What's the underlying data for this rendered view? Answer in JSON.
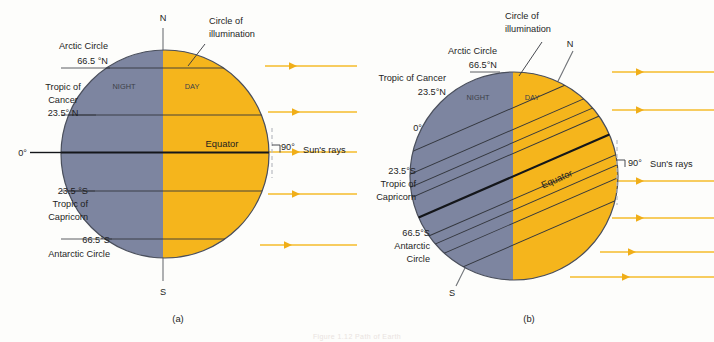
{
  "figure": {
    "title_faint": "Figure 1.12  Path of Earth",
    "background": "#fdfdfb",
    "colors": {
      "night": "#7d85a0",
      "day": "#f5b51c",
      "ray": "#f5bb2b",
      "outline": "#4a4f5c",
      "grid_line": "#33363d",
      "equator_line": "#14161a",
      "axis_line": "#6e7176"
    }
  },
  "panels": [
    {
      "id": "a",
      "caption": "(a)",
      "pole_north_label": "N",
      "pole_south_label": "S",
      "circle_of_illumination_label": "Circle of\nillumination",
      "circle_of_illumination_line1": "Circle of",
      "circle_of_illumination_line2": "illumination",
      "night_label": "NIGHT",
      "day_label": "DAY",
      "equator_label": "Equator",
      "angle_label": "90°",
      "suns_rays_label": "Sun's rays",
      "latitudes": [
        {
          "name": "arctic-circle",
          "lines": [
            "Arctic Circle",
            "66.5 °N"
          ],
          "value": 66.5,
          "hemisphere": "N"
        },
        {
          "name": "tropic-of-cancer",
          "lines": [
            "Tropic of",
            "Cancer",
            "23.5° N"
          ],
          "value": 23.5,
          "hemisphere": "N"
        },
        {
          "name": "equator",
          "lines": [
            "0°"
          ],
          "value": 0,
          "hemisphere": ""
        },
        {
          "name": "tropic-of-capricorn",
          "lines": [
            "23.5 °S",
            "Tropic of",
            "Capricorn"
          ],
          "value": 23.5,
          "hemisphere": "S"
        },
        {
          "name": "antarctic-circle",
          "lines": [
            "66.5°S",
            "Antarctic Circle"
          ],
          "value": 66.5,
          "hemisphere": "S"
        }
      ]
    },
    {
      "id": "b",
      "caption": "(b)",
      "pole_north_label": "N",
      "pole_south_label": "S",
      "circle_of_illumination_line1": "Circle of",
      "circle_of_illumination_line2": "illumination",
      "night_label": "NIGHT",
      "day_label": "DAY",
      "equator_label": "Equator",
      "angle_label": "90°",
      "suns_rays_label": "Sun's rays",
      "latitudes": [
        {
          "name": "arctic-circle",
          "lines": [
            "Arctic Circle",
            "66.5°N"
          ],
          "value": 66.5,
          "hemisphere": "N"
        },
        {
          "name": "tropic-of-cancer",
          "lines": [
            "Tropic of Cancer",
            "23.5°N"
          ],
          "value": 23.5,
          "hemisphere": "N"
        },
        {
          "name": "equator",
          "lines": [
            "0°"
          ],
          "value": 0,
          "hemisphere": ""
        },
        {
          "name": "tropic-of-capricorn",
          "lines": [
            "23.5°S",
            "Tropic of",
            "Capricorn"
          ],
          "value": 23.5,
          "hemisphere": "S"
        },
        {
          "name": "antarctic-circle",
          "lines": [
            "66.5°S",
            "Antarctic",
            "Circle"
          ],
          "value": 66.5,
          "hemisphere": "S"
        }
      ]
    }
  ]
}
